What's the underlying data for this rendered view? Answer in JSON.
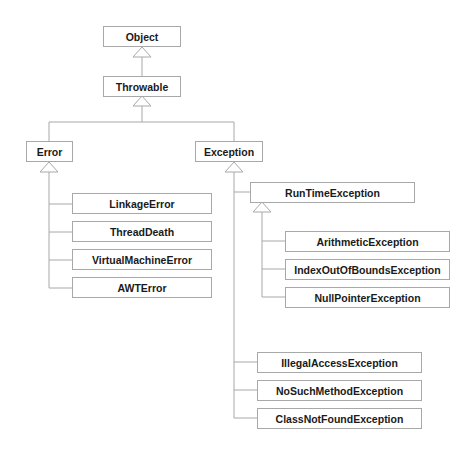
{
  "diagram": {
    "type": "class-inheritance-tree",
    "line_color": "#a8a8a8",
    "nodes": {
      "object": "Object",
      "throwable": "Throwable",
      "error": "Error",
      "exception": "Exception",
      "linkage_error": "LinkageError",
      "thread_death": "ThreadDeath",
      "virtual_machine_error": "VirtualMachineError",
      "awt_error": "AWTError",
      "runtime_exception": "RunTimeException",
      "arithmetic_exception": "ArithmeticException",
      "index_out_of_bounds_exception": "IndexOutOfBoundsException",
      "null_pointer_exception": "NullPointerException",
      "illegal_access_exception": "IllegalAccessException",
      "no_such_method_exception": "NoSuchMethodException",
      "class_not_found_exception": "ClassNotFoundException"
    },
    "edges": [
      {
        "child": "Throwable",
        "parent": "Object"
      },
      {
        "child": "Error",
        "parent": "Throwable"
      },
      {
        "child": "Exception",
        "parent": "Throwable"
      },
      {
        "child": "LinkageError",
        "parent": "Error"
      },
      {
        "child": "ThreadDeath",
        "parent": "Error"
      },
      {
        "child": "VirtualMachineError",
        "parent": "Error"
      },
      {
        "child": "AWTError",
        "parent": "Error"
      },
      {
        "child": "RunTimeException",
        "parent": "Exception"
      },
      {
        "child": "ArithmeticException",
        "parent": "RunTimeException"
      },
      {
        "child": "IndexOutOfBoundsException",
        "parent": "RunTimeException"
      },
      {
        "child": "NullPointerException",
        "parent": "RunTimeException"
      },
      {
        "child": "IllegalAccessException",
        "parent": "Exception"
      },
      {
        "child": "NoSuchMethodException",
        "parent": "Exception"
      },
      {
        "child": "ClassNotFoundException",
        "parent": "Exception"
      }
    ]
  }
}
